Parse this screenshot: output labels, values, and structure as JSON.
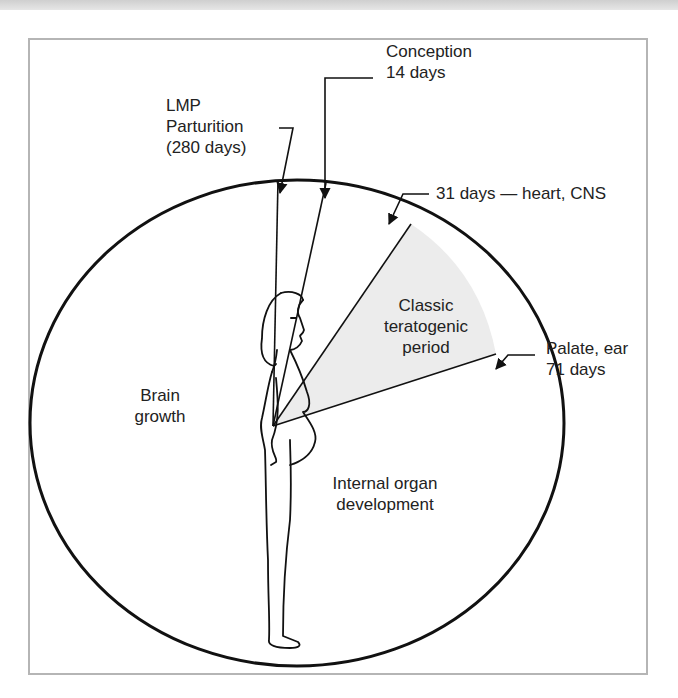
{
  "diagram": {
    "type": "radial developmental timeline",
    "colors": {
      "line": "#111111",
      "sector_fill": "#ececec",
      "frame_border": "#b5b5b5",
      "text": "#222222"
    },
    "labels": {
      "lmp": "LMP",
      "parturition": "Parturition",
      "parturition_days": "(280 days)",
      "conception": "Conception",
      "conception_days": "14 days",
      "heart_cns": "31 days — heart, CNS",
      "palate_ear": "Palate, ear",
      "palate_ear_days": "71 days",
      "classic_line1": "Classic",
      "classic_line2": "teratogenic",
      "classic_line3": "period",
      "brain_line1": "Brain",
      "brain_line2": "growth",
      "organ_line1": "Internal organ",
      "organ_line2": "development"
    },
    "markers": [
      {
        "name": "LMP / Parturition",
        "day": 0,
        "alt_day": 280
      },
      {
        "name": "Conception",
        "day": 14
      },
      {
        "name": "Heart, CNS",
        "day": 31
      },
      {
        "name": "Palate, ear",
        "day": 71
      }
    ],
    "regions": [
      {
        "name": "Classic teratogenic period",
        "from_day": 31,
        "to_day": 71,
        "shaded": true
      },
      {
        "name": "Internal organ development",
        "shaded": false
      },
      {
        "name": "Brain growth",
        "shaded": false
      }
    ],
    "figure": "pregnant woman standing in profile"
  }
}
